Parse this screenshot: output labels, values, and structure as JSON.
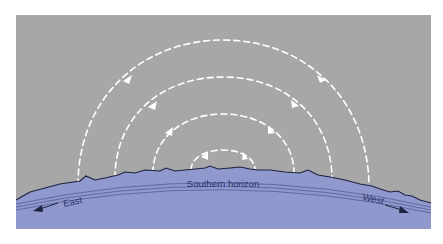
{
  "diagram": {
    "labels": {
      "horizon": "Southern horizon",
      "east": "East",
      "west": "West"
    },
    "colors": {
      "sky": "#a7a7a7",
      "ground": "#8f99cd",
      "ridge": "#1e2140",
      "arc": "#ffffff",
      "text": "#2a3370"
    },
    "arcs": [
      {
        "name": "outer-path",
        "x_start": 78,
        "x_end": 369,
        "top_y": 40
      },
      {
        "name": "second-path",
        "x_start": 115,
        "x_end": 332,
        "top_y": 77
      },
      {
        "name": "third-path",
        "x_start": 153,
        "x_end": 294,
        "top_y": 114
      },
      {
        "name": "inner-path",
        "x_start": 191,
        "x_end": 255,
        "top_y": 150
      }
    ]
  }
}
